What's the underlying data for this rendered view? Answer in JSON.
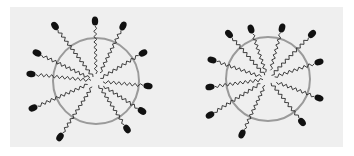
{
  "figure": {
    "colors": {
      "page_bg": "#ffffff",
      "panel_bg": "#efefef",
      "circle_stroke": "#9a9a9a",
      "tail_stroke": "#2a2a2a",
      "head_fill": "#111111"
    },
    "micelles": [
      {
        "name": "micelle-left",
        "center": [
          96,
          81
        ],
        "radius": 43,
        "heads": [
          [
            55,
            26
          ],
          [
            95,
            21
          ],
          [
            123,
            26
          ],
          [
            143,
            53
          ],
          [
            148,
            86
          ],
          [
            142,
            111
          ],
          [
            127,
            129
          ],
          [
            60,
            137
          ],
          [
            33,
            108
          ],
          [
            31,
            74
          ],
          [
            37,
            53
          ]
        ]
      },
      {
        "name": "micelle-right",
        "center": [
          268,
          79
        ],
        "radius": 42,
        "heads": [
          [
            229,
            34
          ],
          [
            251,
            29
          ],
          [
            282,
            28
          ],
          [
            312,
            34
          ],
          [
            319,
            62
          ],
          [
            319,
            98
          ],
          [
            302,
            122
          ],
          [
            242,
            134
          ],
          [
            210,
            115
          ],
          [
            210,
            87
          ],
          [
            212,
            60
          ]
        ]
      }
    ]
  }
}
